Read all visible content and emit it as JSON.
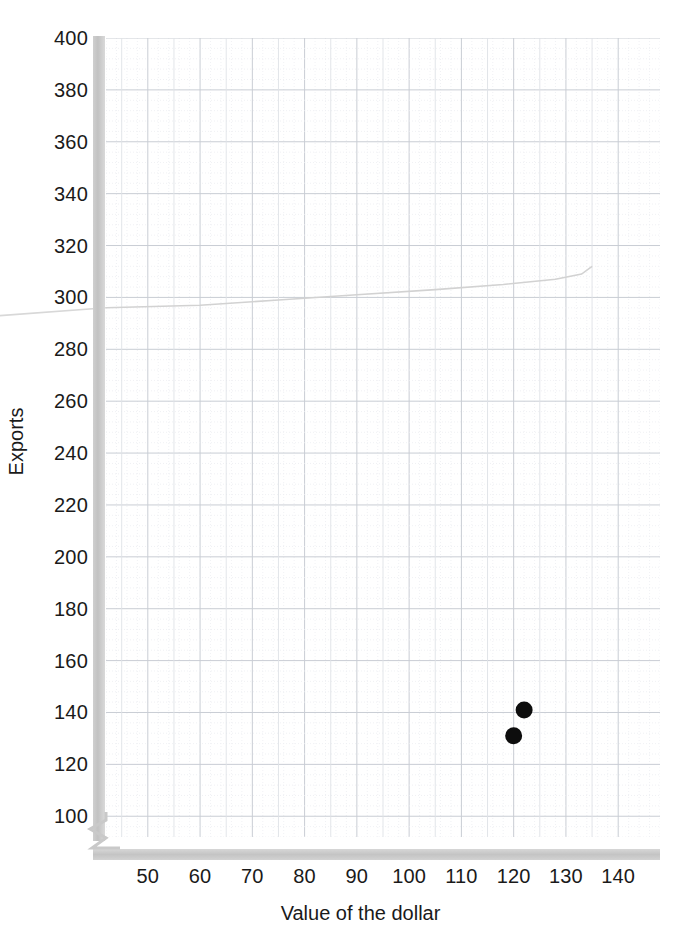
{
  "chart_data": {
    "type": "scatter",
    "title": "",
    "xlabel": "Value of the dollar",
    "ylabel": "Exports",
    "xlim": [
      42,
      148
    ],
    "ylim": [
      92,
      400
    ],
    "xticks": [
      50,
      60,
      70,
      80,
      90,
      100,
      110,
      120,
      130,
      140
    ],
    "yticks": [
      100,
      120,
      140,
      160,
      180,
      200,
      220,
      240,
      260,
      280,
      300,
      320,
      340,
      360,
      380,
      400
    ],
    "grid": "major-and-minor",
    "legend": "none",
    "axis_break": {
      "axis": "y",
      "note": "zigzag break below 100"
    },
    "series": [
      {
        "name": "data-points",
        "type": "scatter",
        "marker": "filled-circle",
        "color": "#0d0d0d",
        "points": [
          {
            "x": 122,
            "y": 141
          },
          {
            "x": 120,
            "y": 131
          }
        ]
      },
      {
        "name": "supply-curve",
        "type": "line",
        "color": "#d2d2d2",
        "points": [
          {
            "x": 42,
            "y": 296
          },
          {
            "x": 60,
            "y": 297
          },
          {
            "x": 75,
            "y": 299
          },
          {
            "x": 90,
            "y": 301
          },
          {
            "x": 105,
            "y": 303
          },
          {
            "x": 118,
            "y": 305
          },
          {
            "x": 128,
            "y": 307
          },
          {
            "x": 133,
            "y": 309
          },
          {
            "x": 135,
            "y": 312
          }
        ]
      }
    ]
  },
  "axes": {
    "y_title": "Exports",
    "x_title": "Value of the dollar"
  }
}
